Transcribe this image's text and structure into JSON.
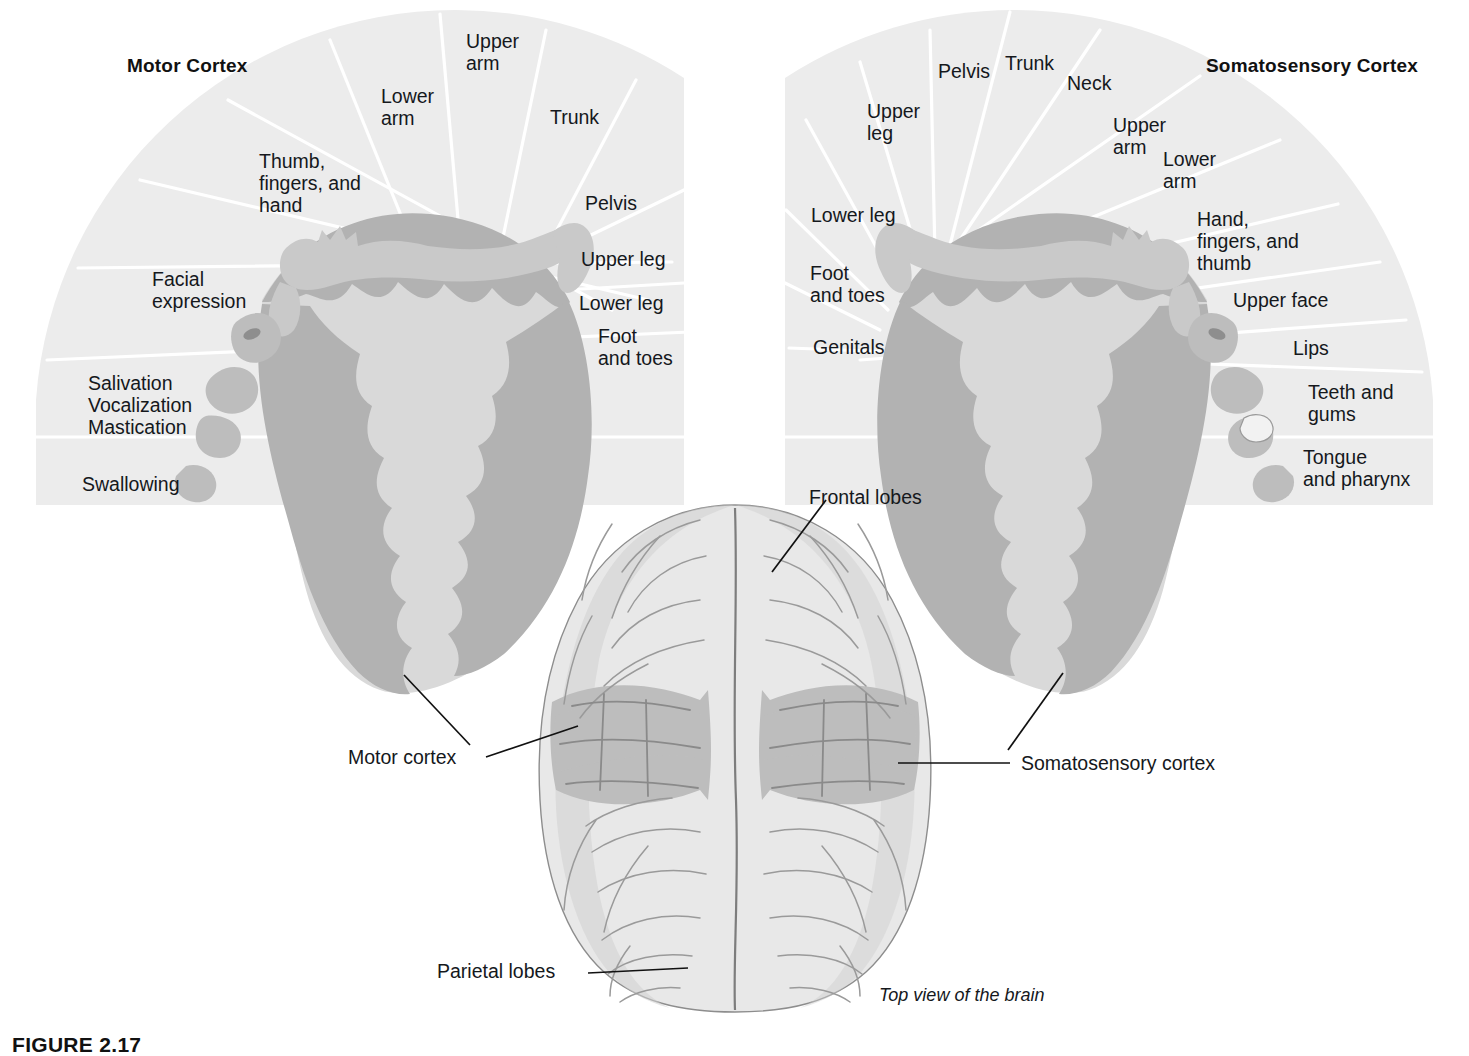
{
  "figure": {
    "caption_label": "FIGURE 2.17",
    "top_view_caption": "Top view of the brain"
  },
  "motor_panel": {
    "title": "Motor Cortex",
    "segments": [
      {
        "id": "swallowing",
        "label": "Swallowing"
      },
      {
        "id": "salivation-vocalization-mastication",
        "label": "Salivation\nVocalization\nMastication"
      },
      {
        "id": "facial-expression",
        "label": "Facial\nexpression"
      },
      {
        "id": "thumb-fingers-hand",
        "label": "Thumb,\nfingers, and\nhand"
      },
      {
        "id": "lower-arm",
        "label": "Lower\narm"
      },
      {
        "id": "upper-arm",
        "label": "Upper\narm"
      },
      {
        "id": "trunk",
        "label": "Trunk"
      },
      {
        "id": "pelvis",
        "label": "Pelvis"
      },
      {
        "id": "upper-leg",
        "label": "Upper leg"
      },
      {
        "id": "lower-leg",
        "label": "Lower leg"
      },
      {
        "id": "foot-and-toes",
        "label": "Foot\nand toes"
      }
    ]
  },
  "somatosensory_panel": {
    "title": "Somatosensory Cortex",
    "segments": [
      {
        "id": "genitals",
        "label": "Genitals"
      },
      {
        "id": "foot-and-toes",
        "label": "Foot\nand toes"
      },
      {
        "id": "lower-leg",
        "label": "Lower leg"
      },
      {
        "id": "upper-leg",
        "label": "Upper\nleg"
      },
      {
        "id": "pelvis",
        "label": "Pelvis"
      },
      {
        "id": "trunk",
        "label": "Trunk"
      },
      {
        "id": "neck",
        "label": "Neck"
      },
      {
        "id": "upper-arm",
        "label": "Upper\narm"
      },
      {
        "id": "lower-arm",
        "label": "Lower\narm"
      },
      {
        "id": "hand-fingers-thumb",
        "label": "Hand,\nfingers, and\nthumb"
      },
      {
        "id": "upper-face",
        "label": "Upper face"
      },
      {
        "id": "lips",
        "label": "Lips"
      },
      {
        "id": "teeth-and-gums",
        "label": "Teeth and\ngums"
      },
      {
        "id": "tongue-and-pharynx",
        "label": "Tongue\nand pharynx"
      }
    ]
  },
  "brain_view": {
    "leaders": [
      {
        "id": "frontal-lobes",
        "label": "Frontal lobes"
      },
      {
        "id": "parietal-lobes",
        "label": "Parietal lobes"
      },
      {
        "id": "motor-cortex",
        "label": "Motor cortex"
      },
      {
        "id": "somatosensory-cortex",
        "label": "Somatosensory cortex"
      }
    ]
  },
  "colors": {
    "fan_fill": "#ececec",
    "divider": "#ffffff",
    "cortex_ribbon": "#b2b2b2",
    "cortex_inner": "#d9d9d9",
    "brain_light": "#e8e8e8",
    "brain_strip": "#bdbdbd",
    "text": "#15181c"
  }
}
